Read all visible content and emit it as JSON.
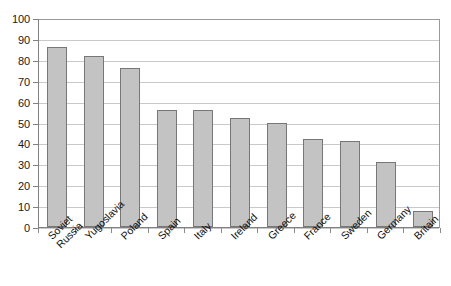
{
  "chart_data": {
    "type": "bar",
    "title": "",
    "subtitle": "",
    "xlabel": "",
    "ylabel": "",
    "categories": [
      "Soviet Russia",
      "Yugoslavia",
      "Poland",
      "Spain",
      "Italy",
      "Ireland",
      "Greece",
      "France",
      "Sweden",
      "Germany",
      "Britain"
    ],
    "category_lines": [
      [
        "Soviet",
        "Russia"
      ],
      [
        "Yugoslavia"
      ],
      [
        "Poland"
      ],
      [
        "Spain"
      ],
      [
        "Italy"
      ],
      [
        "Ireland"
      ],
      [
        "Greece"
      ],
      [
        "France"
      ],
      [
        "Sweden"
      ],
      [
        "Germany"
      ],
      [
        "Britain"
      ]
    ],
    "values": [
      86,
      82,
      76,
      56,
      56,
      52,
      50,
      42,
      41,
      31,
      7.5
    ],
    "ylim": [
      0,
      100
    ],
    "ytick_values": [
      0,
      10,
      20,
      30,
      40,
      50,
      60,
      70,
      80,
      90,
      100
    ],
    "ytick_labels": [
      "0",
      "10",
      "20",
      "30",
      "40",
      "50",
      "60",
      "70",
      "80",
      "90",
      "100"
    ],
    "grid": true,
    "grid_axis": "y",
    "legend": false,
    "legend_position": "none",
    "series": [
      {
        "name": "",
        "values": [
          86,
          82,
          76,
          56,
          56,
          52,
          50,
          42,
          41,
          31,
          7.5
        ]
      }
    ],
    "colors": {
      "bar_fill": "#c3c3c3",
      "bar_border": "#777777",
      "gridline": "#c9c9c9",
      "axis": "#808080",
      "text": "#111111",
      "background": "#ffffff"
    }
  }
}
